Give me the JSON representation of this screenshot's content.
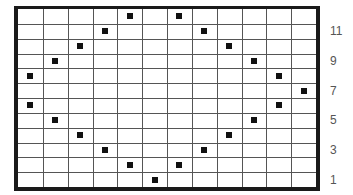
{
  "chart": {
    "columns": 12,
    "rows": 12,
    "row_labels": [
      "11",
      "9",
      "7",
      "5",
      "3",
      "1"
    ],
    "row_label_rows": [
      11,
      9,
      7,
      5,
      3,
      1
    ],
    "stitch_color": "#111111",
    "grid_color": "#555555",
    "border_color": "#1a1a1a",
    "stitches": [
      {
        "row": 12,
        "col": 5
      },
      {
        "row": 12,
        "col": 7
      },
      {
        "row": 11,
        "col": 4
      },
      {
        "row": 11,
        "col": 8
      },
      {
        "row": 10,
        "col": 3
      },
      {
        "row": 10,
        "col": 9
      },
      {
        "row": 9,
        "col": 2
      },
      {
        "row": 9,
        "col": 10
      },
      {
        "row": 8,
        "col": 1
      },
      {
        "row": 8,
        "col": 11
      },
      {
        "row": 7,
        "col": 12
      },
      {
        "row": 6,
        "col": 1
      },
      {
        "row": 6,
        "col": 11
      },
      {
        "row": 5,
        "col": 2
      },
      {
        "row": 5,
        "col": 10
      },
      {
        "row": 4,
        "col": 3
      },
      {
        "row": 4,
        "col": 9
      },
      {
        "row": 3,
        "col": 4
      },
      {
        "row": 3,
        "col": 8
      },
      {
        "row": 2,
        "col": 5
      },
      {
        "row": 2,
        "col": 7
      },
      {
        "row": 1,
        "col": 6
      }
    ]
  }
}
